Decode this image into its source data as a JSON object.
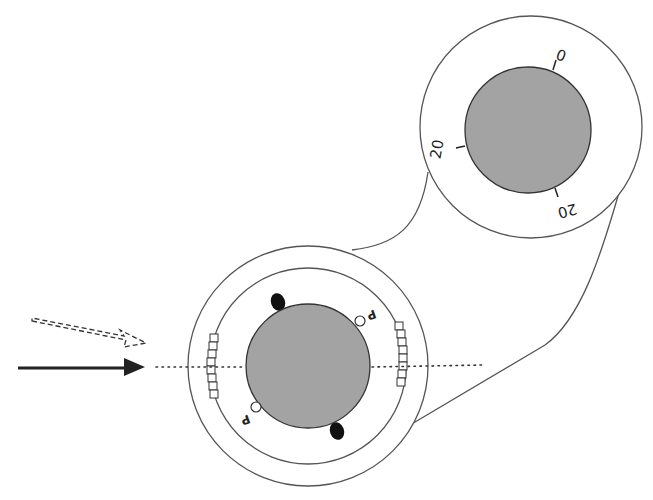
{
  "diagram": {
    "colors": {
      "lens_fill": "#a3a3a3",
      "line": "#444444",
      "marker": "#111111",
      "background": "#ffffff"
    },
    "magnified_view": {
      "scale_labels": [
        {
          "id": "top",
          "text": "0"
        },
        {
          "id": "left",
          "text": "20"
        },
        {
          "id": "bottom",
          "text": "20"
        }
      ]
    },
    "eye_view": {
      "markers": [
        {
          "id": "upper-right",
          "label": "P"
        },
        {
          "id": "lower-left",
          "label": "P"
        }
      ],
      "axis_marks": [
        "left",
        "right"
      ],
      "haptic_dots": [
        "top-left",
        "bottom-right"
      ]
    },
    "arrows": [
      {
        "id": "solid",
        "style": "solid",
        "meaning": "incoming direction"
      },
      {
        "id": "dashed",
        "style": "dashed",
        "meaning": "rotated direction"
      }
    ]
  }
}
